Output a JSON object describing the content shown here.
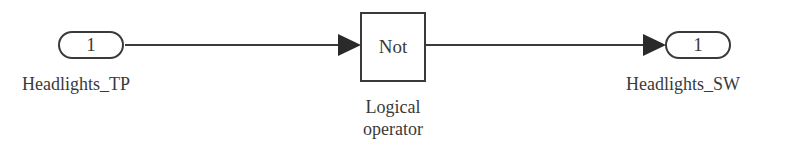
{
  "diagram": {
    "type": "simulink-block-diagram",
    "inport": {
      "number": "1",
      "name": "Headlights_TP"
    },
    "block": {
      "text": "Not",
      "label_line1": "Logical",
      "label_line2": "operator"
    },
    "outport": {
      "number": "1",
      "name": "Headlights_SW"
    },
    "connections": [
      {
        "from": "Headlights_TP",
        "to": "Logical operator"
      },
      {
        "from": "Logical operator",
        "to": "Headlights_SW"
      }
    ],
    "colors": {
      "stroke": "#3a3a3a",
      "background": "#ffffff"
    }
  }
}
